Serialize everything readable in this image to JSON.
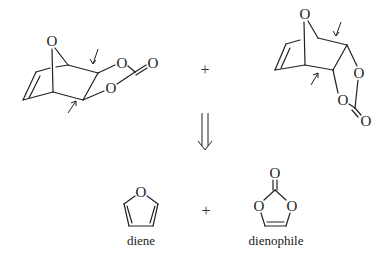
{
  "diagram": {
    "type": "retrosynthesis",
    "products": [
      {
        "name": "endo-adduct",
        "atoms": [
          "O",
          "O",
          "O",
          "O"
        ]
      },
      {
        "name": "exo-adduct",
        "atoms": [
          "O",
          "O",
          "O",
          "O"
        ]
      }
    ],
    "operators": {
      "plus_top": "+",
      "plus_bottom": "+"
    },
    "retro_arrow": "⟹",
    "reactants": [
      {
        "name": "furan",
        "label": "diene",
        "atoms": [
          "O"
        ]
      },
      {
        "name": "vinylene-carbonate",
        "label": "dienophile",
        "atoms": [
          "O",
          "O",
          "O"
        ]
      }
    ],
    "atom_symbol": "O"
  }
}
